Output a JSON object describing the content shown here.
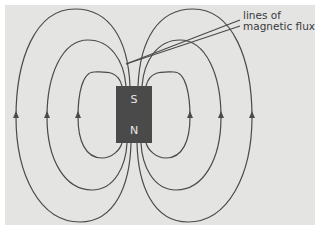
{
  "diagram": {
    "annotation": {
      "line1": "lines of",
      "line2": "magnetic flux"
    },
    "magnet": {
      "top_pole": "S",
      "bottom_pole": "N",
      "color": "#4a4a4a"
    },
    "background_color": "#e4e4e2",
    "line_color": "#4a4a4a"
  }
}
